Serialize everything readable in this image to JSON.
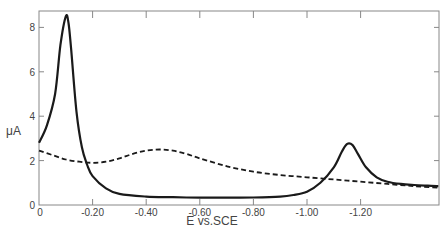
{
  "chart_data": {
    "type": "line",
    "title": "",
    "xlabel": "E vs.SCE",
    "ylabel": "μA",
    "xlim": [
      0,
      -1.5
    ],
    "ylim": [
      0,
      8.6
    ],
    "x_ticks": [
      0,
      -0.2,
      -0.4,
      -0.6,
      -0.8,
      -1.0,
      -1.2
    ],
    "x_tick_labels": [
      "0",
      "-0.20",
      "-0.40",
      "-0.60",
      "-0.80",
      "-1.00",
      "-1.20"
    ],
    "y_ticks": [
      0,
      2,
      4,
      6,
      8
    ],
    "y_tick_labels": [
      "0",
      "2",
      "4",
      "6",
      "8"
    ],
    "grid": false,
    "legend": null,
    "series": [
      {
        "name": "solid",
        "style": "solid",
        "x": [
          0,
          -0.03,
          -0.06,
          -0.08,
          -0.1,
          -0.11,
          -0.12,
          -0.14,
          -0.16,
          -0.18,
          -0.2,
          -0.25,
          -0.3,
          -0.4,
          -0.5,
          -0.6,
          -0.7,
          -0.8,
          -0.9,
          -0.95,
          -1.0,
          -1.05,
          -1.1,
          -1.13,
          -1.15,
          -1.17,
          -1.19,
          -1.22,
          -1.26,
          -1.3,
          -1.35,
          -1.4,
          -1.45,
          -1.49
        ],
        "y": [
          2.8,
          3.6,
          5.0,
          7.2,
          8.5,
          8.2,
          7.0,
          4.2,
          2.6,
          1.8,
          1.3,
          0.75,
          0.5,
          0.38,
          0.35,
          0.33,
          0.33,
          0.34,
          0.38,
          0.45,
          0.6,
          1.0,
          1.7,
          2.4,
          2.75,
          2.7,
          2.3,
          1.7,
          1.25,
          1.05,
          0.95,
          0.9,
          0.87,
          0.85
        ]
      },
      {
        "name": "dashed",
        "style": "dashed",
        "x": [
          0,
          -0.05,
          -0.1,
          -0.15,
          -0.2,
          -0.25,
          -0.3,
          -0.35,
          -0.4,
          -0.45,
          -0.5,
          -0.55,
          -0.6,
          -0.7,
          -0.8,
          -0.9,
          -1.0,
          -1.1,
          -1.2,
          -1.3,
          -1.4,
          -1.49
        ],
        "y": [
          2.45,
          2.25,
          2.05,
          1.95,
          1.9,
          1.95,
          2.1,
          2.3,
          2.45,
          2.5,
          2.45,
          2.3,
          2.1,
          1.75,
          1.5,
          1.35,
          1.25,
          1.15,
          1.05,
          0.95,
          0.85,
          0.78
        ]
      }
    ]
  },
  "axes": {
    "x_title": "E vs.SCE",
    "y_title": "μA",
    "origin_label_y": "0",
    "origin_label_x": "0"
  },
  "colors": {
    "line": "#1a1a1a",
    "axis": "#888888",
    "text": "#444444"
  }
}
